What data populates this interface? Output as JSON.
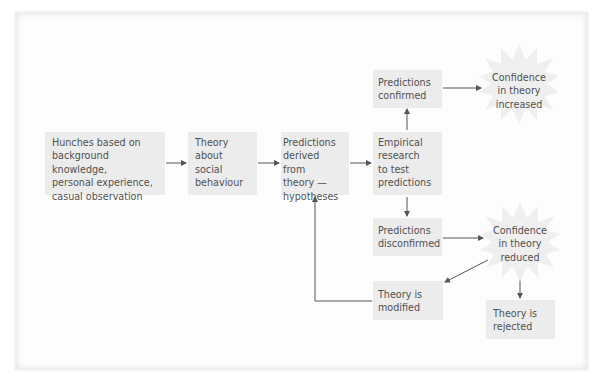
{
  "diagram": {
    "boxes": {
      "hunches": "Hunches based on background knowledge, personal experience, casual observation",
      "theory": "Theory about social behaviour",
      "predictions_derived": "Predictions derived from theory — hypotheses",
      "empirical": "Empirical research to test predictions",
      "confirmed": "Predictions confirmed",
      "disconfirmed": "Predictions disconfirmed",
      "modified": "Theory is modified",
      "rejected": "Theory is rejected"
    },
    "bursts": {
      "increased": "Confidence in theory increased",
      "reduced": "Confidence in theory reduced"
    },
    "lines": {
      "hunches": [
        "Hunches based on",
        "background knowledge,",
        "personal experience,",
        "casual observation"
      ],
      "theory": [
        "Theory",
        "about",
        "social",
        "behaviour"
      ],
      "predictions_derived": [
        "Predictions",
        "derived from",
        "theory —",
        "hypotheses"
      ],
      "empirical": [
        "Empirical",
        "research",
        "to test",
        "predictions"
      ],
      "confirmed": [
        "Predictions",
        "confirmed"
      ],
      "disconfirmed": [
        "Predictions",
        "disconfirmed"
      ],
      "modified": [
        "Theory is",
        "modified"
      ],
      "rejected": [
        "Theory is",
        "rejected"
      ],
      "increased": [
        "Confidence",
        "in theory",
        "increased"
      ],
      "reduced": [
        "Confidence",
        "in theory",
        "reduced"
      ]
    },
    "colors": {
      "box": "#ececec",
      "burst": "#eeeeee",
      "arrow": "#555555",
      "text": "#505050"
    }
  }
}
